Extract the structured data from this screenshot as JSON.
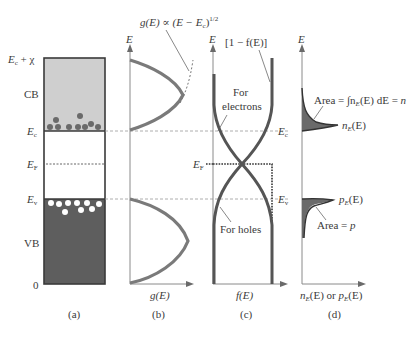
{
  "figure": {
    "colors": {
      "cb_fill": "#cfcfcf",
      "vb_fill": "#5e5e5e",
      "curve": "#6f6f6f",
      "dark_curve": "#4a4a4a",
      "electron_dot": "#6a6a6a",
      "hole_dot": "#ffffff",
      "axis": "#8a8a8a",
      "dashed": "#9a9a9a",
      "area_fill": "#6a6a6a",
      "text": "#3a3a3a"
    },
    "panel_a": {
      "caption": "(a)",
      "labels": {
        "top": "Ec + χ",
        "top_main": "E",
        "top_sub": "c",
        "top_suffix": " + χ",
        "cb": "CB",
        "ec_main": "E",
        "ec_sub": "c",
        "ef_main": "E",
        "ef_sub": "F",
        "ev_main": "E",
        "ev_sub": "v",
        "vb": "VB",
        "zero": "0"
      },
      "electron_count": 10,
      "hole_count": 9
    },
    "panel_b": {
      "caption": "(b)",
      "y_axis_label": "E",
      "x_axis_label": "g(E)",
      "annotation": "g(E) ∝ (E − Ec)^1/2",
      "annotation_main": "g(E) ∝ (E − E",
      "annotation_sub": "c",
      "annotation_close": ")",
      "annotation_sup": "1/2"
    },
    "panel_c": {
      "caption": "(c)",
      "y_axis_label": "E",
      "x_axis_label": "f(E)",
      "top_label": "[1 − f(E)]",
      "electrons_label_line1": "For",
      "electrons_label_line2": "electrons",
      "holes_label": "For holes",
      "ef_main": "E",
      "ef_sub": "F",
      "ec_main": "E",
      "ec_sub": "c",
      "ev_main": "E",
      "ev_sub": "v"
    },
    "panel_d": {
      "caption": "(d)",
      "y_axis_label": "E",
      "x_axis_label": "nE(E) or pE(E)",
      "x_axis_n": "n",
      "x_axis_n_sub": "E",
      "x_axis_mid": "(E) or ",
      "x_axis_p": "p",
      "x_axis_p_sub": "E",
      "x_axis_end": "(E)",
      "n_area_label": "Area = ∫nE(E) dE = n",
      "n_area_pre": "Area = ∫n",
      "n_area_sub": "E",
      "n_area_post": "(E) dE = ",
      "n_area_n": "n",
      "n_curve_label": "nE(E)",
      "p_curve_label": "pE(E)",
      "p_area_label": "Area = p",
      "p_area_pre": "Area = ",
      "p_area_p": "p"
    }
  }
}
